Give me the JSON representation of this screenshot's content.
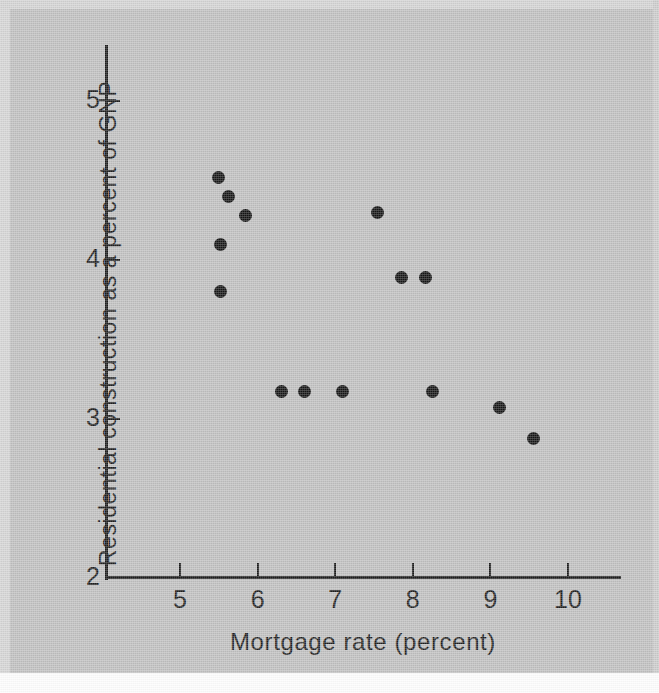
{
  "figure": {
    "background_color": "#bfbfbf",
    "ink_color": "#1b1b1b",
    "point_color": "#141414"
  },
  "chart_data": {
    "type": "scatter",
    "title": "",
    "xlabel": "Mortgage rate (percent)",
    "ylabel": "Residential construction as a percent of GNP",
    "xlim": [
      4.68,
      10.67
    ],
    "ylim": [
      2,
      5.34
    ],
    "xticks": [
      5,
      6,
      7,
      8,
      9,
      10
    ],
    "xticklabels": [
      "5",
      "6",
      "7",
      "8",
      "9",
      "10"
    ],
    "yticks": [
      2,
      3,
      4,
      5
    ],
    "yticklabels": [
      "2",
      "3",
      "4",
      "5"
    ],
    "grid": false,
    "legend": null,
    "series": [
      {
        "name": "Residential construction vs mortgage rate",
        "marker": "filled-circle",
        "points": [
          {
            "x": 5.5,
            "y": 4.52
          },
          {
            "x": 5.63,
            "y": 4.4
          },
          {
            "x": 5.85,
            "y": 4.28
          },
          {
            "x": 5.52,
            "y": 4.1
          },
          {
            "x": 5.52,
            "y": 3.8
          },
          {
            "x": 7.54,
            "y": 4.3
          },
          {
            "x": 7.85,
            "y": 3.89
          },
          {
            "x": 8.16,
            "y": 3.89
          },
          {
            "x": 6.31,
            "y": 3.17
          },
          {
            "x": 6.6,
            "y": 3.17
          },
          {
            "x": 7.09,
            "y": 3.17
          },
          {
            "x": 8.25,
            "y": 3.17
          },
          {
            "x": 9.12,
            "y": 3.07
          },
          {
            "x": 9.55,
            "y": 2.88
          }
        ]
      }
    ]
  }
}
